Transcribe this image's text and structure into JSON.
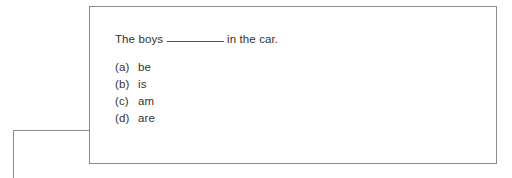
{
  "card": {
    "question": {
      "text_before_blank": "The boys",
      "blank": "________",
      "text_after_blank": "in the car."
    },
    "options": [
      {
        "letter": "(a)",
        "text": "be"
      },
      {
        "letter": "(b)",
        "text": "is"
      },
      {
        "letter": "(c)",
        "text": "am"
      },
      {
        "letter": "(d)",
        "text": "are"
      }
    ]
  },
  "annotation": {
    "callout_target_option": "(d)",
    "line_color": "#8c8c8c"
  },
  "colors": {
    "text": "#333333",
    "border": "#8c8c8c",
    "background": "#ffffff",
    "blank_rule": "#555555"
  }
}
